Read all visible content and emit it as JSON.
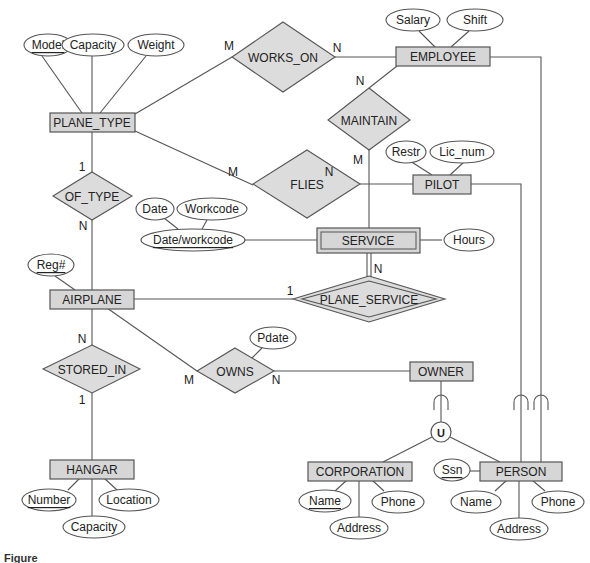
{
  "figure": {
    "caption": "Figure"
  },
  "entities": {
    "plane_type": "PLANE_TYPE",
    "employee": "EMPLOYEE",
    "pilot": "PILOT",
    "service": "SERVICE",
    "airplane": "AIRPLANE",
    "owner": "OWNER",
    "hangar": "HANGAR",
    "corporation": "CORPORATION",
    "person": "PERSON"
  },
  "relationships": {
    "works_on": "WORKS_ON",
    "maintain": "MAINTAIN",
    "flies": "FLIES",
    "of_type": "OF_TYPE",
    "plane_service": "PLANE_SERVICE",
    "stored_in": "STORED_IN",
    "owns": "OWNS"
  },
  "attributes": {
    "plane_type": {
      "model": "Model",
      "capacity": "Capacity",
      "weight": "Weight"
    },
    "employee": {
      "salary": "Salary",
      "shift": "Shift"
    },
    "pilot": {
      "restr": "Restr",
      "lic_num": "Lic_num"
    },
    "service": {
      "date": "Date",
      "workcode": "Workcode",
      "date_workcode": "Date/workcode",
      "hours": "Hours"
    },
    "airplane": {
      "reg": "Reg#"
    },
    "owns": {
      "pdate": "Pdate"
    },
    "hangar": {
      "number": "Number",
      "location": "Location",
      "capacity": "Capacity"
    },
    "corporation": {
      "name": "Name",
      "phone": "Phone",
      "address": "Address"
    },
    "person": {
      "ssn": "Ssn",
      "name": "Name",
      "phone": "Phone",
      "address": "Address"
    }
  },
  "union": {
    "symbol": "U"
  },
  "cardinalities": {
    "works_on_plane_type": "M",
    "works_on_employee": "N",
    "maintain_employee": "N",
    "maintain_service": "M",
    "flies_plane_type": "M",
    "flies_pilot": "N",
    "of_type_plane_type": "1",
    "of_type_airplane": "N",
    "plane_service_airplane": "1",
    "plane_service_service": "N",
    "stored_in_airplane": "N",
    "stored_in_hangar": "1",
    "owns_airplane": "M",
    "owns_owner": "N"
  }
}
